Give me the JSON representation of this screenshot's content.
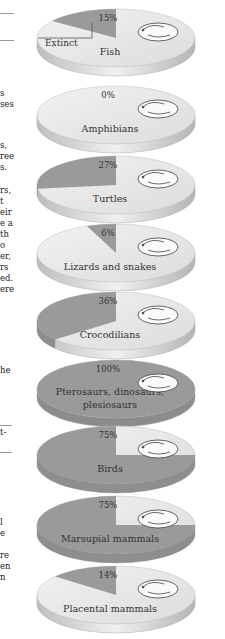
{
  "margin_text": {
    "fragments": [
      {
        "text": "s",
        "y": 93
      },
      {
        "text": "ses",
        "y": 104
      },
      {
        "text": "s,",
        "y": 145
      },
      {
        "text": "ree",
        "y": 156
      },
      {
        "text": "s.",
        "y": 167
      },
      {
        "text": "rs,",
        "y": 190
      },
      {
        "text": "t",
        "y": 201
      },
      {
        "text": "eir",
        "y": 212
      },
      {
        "text": "e a",
        "y": 223
      },
      {
        "text": "th",
        "y": 234
      },
      {
        "text": "o",
        "y": 245
      },
      {
        "text": "er,",
        "y": 256
      },
      {
        "text": "rs",
        "y": 267
      },
      {
        "text": "ed.",
        "y": 278
      },
      {
        "text": "ere",
        "y": 289
      },
      {
        "text": "he",
        "y": 370
      },
      {
        "text": "t-",
        "y": 432
      },
      {
        "text": "l",
        "y": 522
      },
      {
        "text": "e",
        "y": 533
      },
      {
        "text": "re",
        "y": 555
      },
      {
        "text": "en",
        "y": 566
      },
      {
        "text": "n",
        "y": 577
      }
    ]
  },
  "chart_data": {
    "type": "pie",
    "title": "",
    "legend_label": "Extinct",
    "categories": [
      "Fish",
      "Amphibians",
      "Turtles",
      "Lizards and snakes",
      "Crocodilians",
      "Pterosaurs, dinosaurs, plesiosaurs",
      "Birds",
      "Marsupial mammals",
      "Placental mammals"
    ],
    "values": [
      15,
      0,
      27,
      6,
      36,
      100,
      75,
      75,
      14
    ],
    "value_labels": [
      "15%",
      "0%",
      "27%",
      "6%",
      "36%",
      "100%",
      "75%",
      "75%",
      "14%"
    ],
    "unit": "%",
    "colors": {
      "extinct": "#9a9a9a",
      "survived": "#e9e9e9",
      "edge": "#c8c8c8"
    }
  },
  "discs": [
    {
      "name": "Fish",
      "label_lines": [
        "Fish"
      ],
      "pct": 15,
      "pct_label": "15%",
      "animal": "fish-icon"
    },
    {
      "name": "Amphibians",
      "label_lines": [
        "Amphibians"
      ],
      "pct": 0,
      "pct_label": "0%",
      "animal": "frog-icon"
    },
    {
      "name": "Turtles",
      "label_lines": [
        "Turtles"
      ],
      "pct": 27,
      "pct_label": "27%",
      "animal": "turtle-icon"
    },
    {
      "name": "Lizards and snakes",
      "label_lines": [
        "Lizards and snakes"
      ],
      "pct": 6,
      "pct_label": "6%",
      "animal": "snake-icon"
    },
    {
      "name": "Crocodilians",
      "label_lines": [
        "Crocodilians"
      ],
      "pct": 36,
      "pct_label": "36%",
      "animal": "crocodile-icon"
    },
    {
      "name": "Pterosaurs, dinosaurs, plesiosaurs",
      "label_lines": [
        "Pterosaurs, dinosaurs,",
        "plesiosaurs"
      ],
      "pct": 100,
      "pct_label": "100%",
      "animal": "dinosaur-icon"
    },
    {
      "name": "Birds",
      "label_lines": [
        "Birds"
      ],
      "pct": 75,
      "pct_label": "75%",
      "animal": "bird-icon"
    },
    {
      "name": "Marsupial mammals",
      "label_lines": [
        "Marsupial mammals"
      ],
      "pct": 75,
      "pct_label": "75%",
      "animal": "marsupial-icon"
    },
    {
      "name": "Placental mammals",
      "label_lines": [
        "Placental mammals"
      ],
      "pct": 14,
      "pct_label": "14%",
      "animal": "mouse-icon"
    }
  ]
}
